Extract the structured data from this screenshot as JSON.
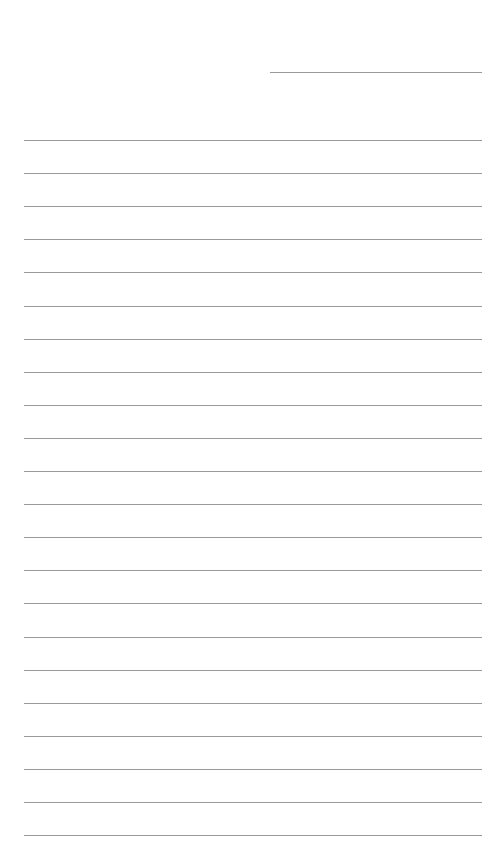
{
  "page": {
    "type": "lined-paper",
    "background": "#ffffff",
    "line_color": "#9a9a9a",
    "header_line": {
      "x": 270,
      "y": 72,
      "width": 212
    },
    "rules": {
      "count": 22,
      "start_y": 140,
      "spacing": 33.1,
      "x": 24,
      "width": 458
    }
  }
}
